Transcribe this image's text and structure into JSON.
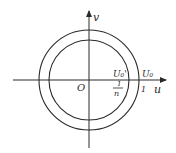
{
  "diagram": {
    "type": "complex-plane-annulus",
    "axes": {
      "horizontal_label": "u",
      "vertical_label": "v",
      "origin_label": "O"
    },
    "circles": [
      {
        "name": "inner",
        "label": "U₀'",
        "radius_label_num": "1",
        "radius_label_den": "n"
      },
      {
        "name": "outer",
        "label": "U₀",
        "radius_label": "1"
      }
    ],
    "colors": {
      "stroke": "#2a2a2a",
      "background": "#ffffff"
    }
  }
}
